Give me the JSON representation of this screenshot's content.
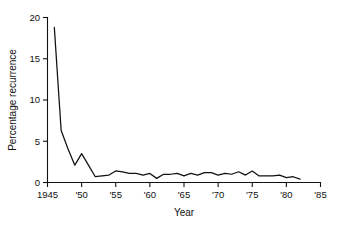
{
  "figure": {
    "background_color": "#ffffff",
    "line_color": "#111111",
    "text_color": "#111111"
  },
  "chart_data": {
    "type": "line",
    "title": "",
    "subtitle": "",
    "xlabel": "Year",
    "ylabel": "Percentage recurrence",
    "xlim": [
      1945,
      1985
    ],
    "ylim": [
      0,
      20
    ],
    "grid": false,
    "legend": null,
    "legend_position": "none",
    "xticks": [
      1945,
      1950,
      1955,
      1960,
      1965,
      1970,
      1975,
      1980,
      1985
    ],
    "xticklabels": [
      "1945",
      "'50",
      "'55",
      "'60",
      "'65",
      "'70",
      "'75",
      "'80",
      "'85"
    ],
    "yticks": [
      0,
      5,
      10,
      15,
      20
    ],
    "yticklabels": [
      "0",
      "5",
      "10",
      "15",
      "20"
    ],
    "annotations": [],
    "series": [
      {
        "name": "Percentage recurrence",
        "color": "#111111",
        "x": [
          1946,
          1947,
          1948,
          1949,
          1950,
          1951,
          1952,
          1953,
          1954,
          1955,
          1956,
          1957,
          1958,
          1959,
          1960,
          1961,
          1962,
          1963,
          1964,
          1965,
          1966,
          1967,
          1968,
          1969,
          1970,
          1971,
          1972,
          1973,
          1974,
          1975,
          1976,
          1977,
          1978,
          1979,
          1980,
          1981,
          1982
        ],
        "values": [
          18.8,
          6.3,
          4.1,
          2.1,
          3.5,
          2.1,
          0.7,
          0.8,
          0.9,
          1.4,
          1.3,
          1.1,
          1.1,
          0.9,
          1.1,
          0.5,
          1.0,
          1.0,
          1.1,
          0.8,
          1.1,
          0.9,
          1.2,
          1.2,
          0.9,
          1.1,
          1.0,
          1.3,
          0.9,
          1.4,
          0.8,
          0.8,
          0.8,
          0.9,
          0.6,
          0.7,
          0.4
        ]
      }
    ]
  }
}
